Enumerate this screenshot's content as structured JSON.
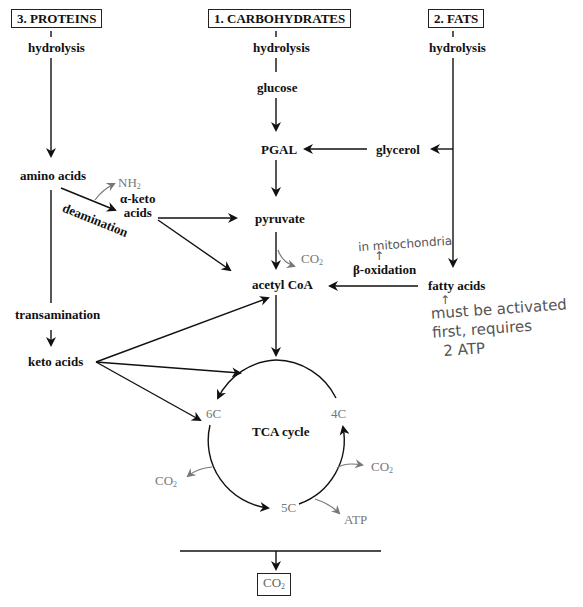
{
  "sources": {
    "proteins": "3. PROTEINS",
    "carbohydrates": "1. CARBOHYDRATES",
    "fats": "2. FATS"
  },
  "proteins_path": {
    "hydrolysis": "hydrolysis",
    "amino_acids": "amino acids",
    "nh2": "NH",
    "nh2_sub": "2",
    "deamination": "deamination",
    "alpha_keto_line1": "α-keto",
    "alpha_keto_line2": "acids",
    "transamination": "transamination",
    "keto_acids": "keto acids"
  },
  "carbohydrates_path": {
    "hydrolysis": "hydrolysis",
    "glucose": "glucose",
    "pgal": "PGAL",
    "pyruvate": "pyruvate",
    "co2": "CO",
    "co2_sub": "2",
    "acetyl_coa": "acetyl CoA"
  },
  "fats_path": {
    "hydrolysis": "hydrolysis",
    "glycerol": "glycerol",
    "fatty_acids": "fatty acids",
    "beta_oxidation": "β-oxidation"
  },
  "tca_cycle": {
    "title": "TCA cycle",
    "c6": "6C",
    "c5": "5C",
    "c4": "4C",
    "co2_left": "CO",
    "co2_right": "CO",
    "co2_sub": "2",
    "atp": "ATP"
  },
  "final_product": {
    "label": "CO",
    "sub": "2"
  },
  "handwritten_notes": {
    "mitochondria": "in mitochondria",
    "arrow": "↑",
    "activation_line1": "must be activated",
    "activation_line2": "first, requires",
    "activation_line3": "2 ATP"
  }
}
